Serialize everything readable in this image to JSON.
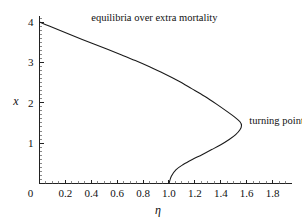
{
  "chart_data": {
    "type": "line",
    "title": "",
    "xlabel": "η",
    "ylabel": "x",
    "xlim": [
      0,
      1.95
    ],
    "ylim": [
      0,
      4.15
    ],
    "grid": false,
    "legend": "none",
    "xticks": [
      "0",
      "0.2",
      "0.4",
      "0.6",
      "0.8",
      "1.0",
      "1.2",
      "1.4",
      "1.6",
      "1.8"
    ],
    "xtick_values": [
      0,
      0.2,
      0.4,
      0.6,
      0.8,
      1.0,
      1.2,
      1.4,
      1.6,
      1.8
    ],
    "yticks": [
      "1",
      "2",
      "3",
      "4"
    ],
    "ytick_values": [
      1,
      2,
      3,
      4
    ],
    "minor_ticks": true,
    "series": [
      {
        "name": "equilibrium branch",
        "color": "#1a1a1a",
        "x": [
          0.0,
          0.075,
          0.155,
          0.24,
          0.33,
          0.425,
          0.525,
          0.63,
          0.74,
          0.85,
          0.96,
          1.07,
          1.175,
          1.275,
          1.37,
          1.45,
          1.51,
          1.548,
          1.56,
          1.548,
          1.515,
          1.465,
          1.4,
          1.33,
          1.255,
          1.18,
          1.11,
          1.055,
          1.018,
          1.0
        ],
        "y": [
          4.0,
          3.9,
          3.795,
          3.685,
          3.57,
          3.45,
          3.325,
          3.19,
          3.045,
          2.89,
          2.725,
          2.545,
          2.35,
          2.16,
          1.96,
          1.78,
          1.64,
          1.53,
          1.44,
          1.33,
          1.21,
          1.09,
          0.96,
          0.84,
          0.715,
          0.595,
          0.47,
          0.345,
          0.18,
          0.0
        ]
      }
    ],
    "annotations": [
      {
        "id": "equilibria-label",
        "text": "equilibria over extra mortality",
        "data_x": 0.4,
        "data_y": 4.02
      },
      {
        "id": "turning-point-label",
        "text": "turning point",
        "data_x": 1.62,
        "data_y": 1.47
      }
    ],
    "turning_point": {
      "x": 1.56,
      "y": 1.44
    },
    "axis_intercepts": {
      "y_axis_at": 4.0,
      "x_axis_at": 1.0
    }
  }
}
